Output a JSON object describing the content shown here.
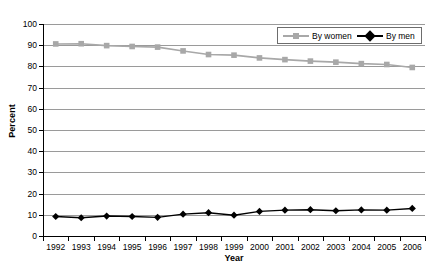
{
  "chart_data": {
    "type": "line",
    "title": "",
    "xlabel": "Year",
    "ylabel": "Percent",
    "ylim": [
      0,
      100
    ],
    "ytick_step": 10,
    "yticks": [
      100,
      90,
      80,
      70,
      60,
      50,
      40,
      30,
      20,
      10,
      0
    ],
    "grid": true,
    "legend_position": "top-right-inside",
    "categories": [
      "1992",
      "1993",
      "1994",
      "1995",
      "1996",
      "1997",
      "1998",
      "1999",
      "2000",
      "2001",
      "2002",
      "2003",
      "2004",
      "2005",
      "2006"
    ],
    "series": [
      {
        "name": "By women",
        "color": "#a8a8a8",
        "marker": "square",
        "values": [
          90.6,
          90.7,
          89.8,
          89.4,
          89.1,
          87.3,
          85.6,
          85.3,
          84.0,
          83.2,
          82.5,
          82.0,
          81.3,
          80.9,
          79.5
        ]
      },
      {
        "name": "By men",
        "color": "#000000",
        "marker": "diamond",
        "values": [
          9.2,
          8.6,
          9.4,
          9.2,
          8.8,
          10.3,
          11.0,
          9.8,
          11.6,
          12.2,
          12.4,
          11.9,
          12.3,
          12.2,
          13.0
        ]
      }
    ]
  },
  "legend": {
    "entries": [
      {
        "label": "By women"
      },
      {
        "label": "By men"
      }
    ]
  },
  "axis": {
    "y_title": "Percent",
    "x_title": "Year"
  }
}
